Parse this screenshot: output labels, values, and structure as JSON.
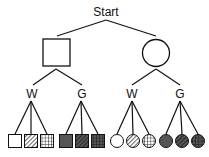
{
  "diagram": {
    "type": "tree",
    "root": {
      "label": "Start"
    },
    "level1": [
      {
        "shape": "square",
        "label": ""
      },
      {
        "shape": "circle",
        "label": ""
      }
    ],
    "level2": [
      {
        "parent": "square",
        "label": "W"
      },
      {
        "parent": "square",
        "label": "G"
      },
      {
        "parent": "circle",
        "label": "W"
      },
      {
        "parent": "circle",
        "label": "G"
      }
    ],
    "leaves": [
      {
        "parent": "square-W",
        "shape": "square",
        "fill": "white",
        "pattern": "solid"
      },
      {
        "parent": "square-W",
        "shape": "square",
        "fill": "white",
        "pattern": "diagonal-stripes"
      },
      {
        "parent": "square-W",
        "shape": "square",
        "fill": "white",
        "pattern": "grid"
      },
      {
        "parent": "square-G",
        "shape": "square",
        "fill": "gray",
        "pattern": "solid"
      },
      {
        "parent": "square-G",
        "shape": "square",
        "fill": "gray",
        "pattern": "diagonal-stripes"
      },
      {
        "parent": "square-G",
        "shape": "square",
        "fill": "gray",
        "pattern": "grid"
      },
      {
        "parent": "circle-W",
        "shape": "circle",
        "fill": "white",
        "pattern": "solid"
      },
      {
        "parent": "circle-W",
        "shape": "circle",
        "fill": "white",
        "pattern": "diagonal-stripes"
      },
      {
        "parent": "circle-W",
        "shape": "circle",
        "fill": "white",
        "pattern": "grid"
      },
      {
        "parent": "circle-G",
        "shape": "circle",
        "fill": "gray",
        "pattern": "solid"
      },
      {
        "parent": "circle-G",
        "shape": "circle",
        "fill": "gray",
        "pattern": "diagonal-stripes"
      },
      {
        "parent": "circle-G",
        "shape": "circle",
        "fill": "gray",
        "pattern": "grid"
      }
    ],
    "colors": {
      "line": "#111111",
      "white_fill": "#ffffff",
      "gray_fill": "#555555"
    }
  }
}
